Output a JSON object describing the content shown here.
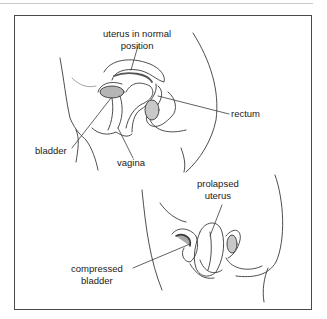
{
  "figure": {
    "panels": [
      {
        "name": "normal",
        "labels": {
          "uterus": [
            "uterus in normal",
            "position"
          ],
          "rectum": "rectum",
          "bladder": "bladder",
          "vagina": "vagina"
        }
      },
      {
        "name": "prolapsed",
        "labels": {
          "uterus": [
            "prolapsed",
            "uterus"
          ],
          "bladder": [
            "compressed",
            "bladder"
          ]
        }
      }
    ],
    "colors": {
      "line": "#3a3a3a",
      "frame": "#4a4a4a",
      "shade": "#9a9a9a"
    }
  }
}
